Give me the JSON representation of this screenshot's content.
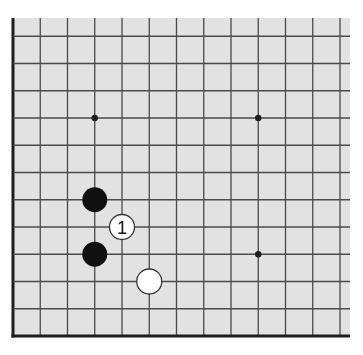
{
  "board": {
    "description": "Go board fragment (lower-left corner region)",
    "colors": {
      "background": "#e2e2e2",
      "grid_line": "#4a4a4a",
      "edge_line": "#1e1e1e",
      "black_stone": "#111111",
      "white_stone": "#ffffff",
      "stone_outline": "#333333",
      "label": "#111111"
    },
    "visible_columns": 13,
    "visible_rows": 12,
    "edges": [
      "left",
      "bottom"
    ],
    "star_points": [
      {
        "col": 3,
        "row": 8
      },
      {
        "col": 9,
        "row": 8
      },
      {
        "col": 9,
        "row": 3
      }
    ],
    "stones": [
      {
        "color": "black",
        "col": 3,
        "row": 5,
        "label": ""
      },
      {
        "color": "black",
        "col": 3,
        "row": 3,
        "label": ""
      },
      {
        "color": "white",
        "col": 4,
        "row": 4,
        "label": "1"
      },
      {
        "color": "white",
        "col": 5,
        "row": 2,
        "label": ""
      }
    ]
  }
}
